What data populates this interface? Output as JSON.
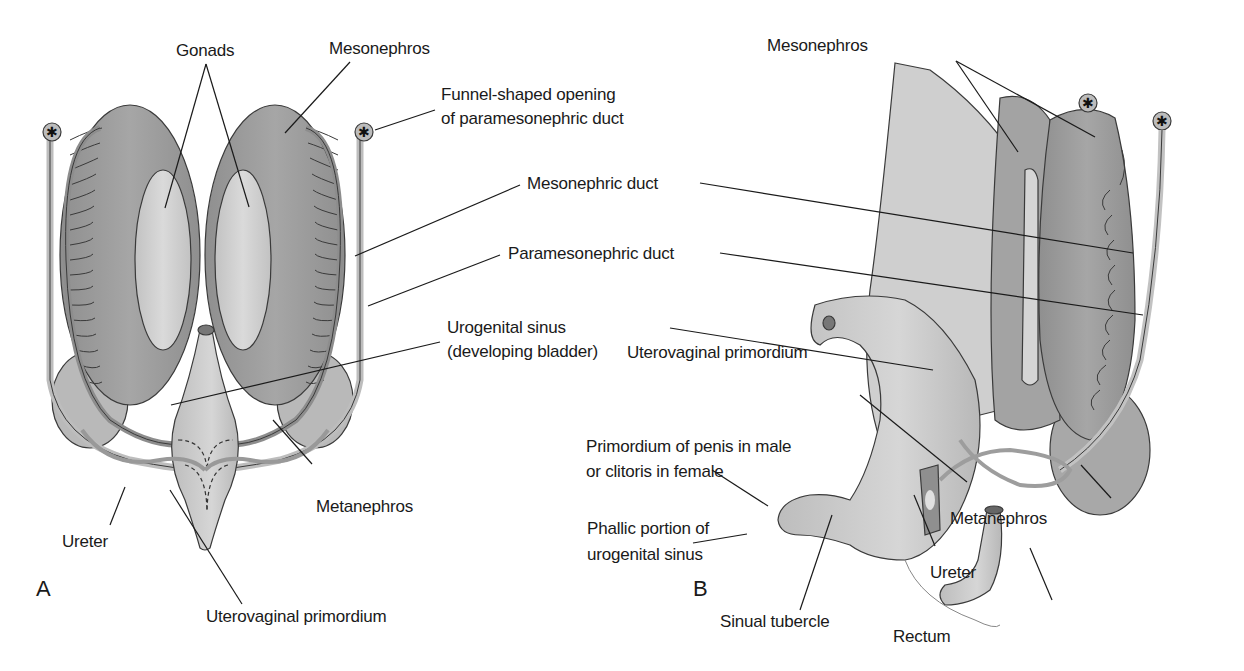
{
  "figure": {
    "panels": [
      {
        "id": "A",
        "label": "A"
      },
      {
        "id": "B",
        "label": "B"
      }
    ],
    "labels_a": {
      "gonads": "Gonads",
      "mesonephros": "Mesonephros",
      "funnel_line1": "Funnel-shaped opening",
      "funnel_line2": "of paramesonephric duct",
      "mesonephric_duct": "Mesonephric duct",
      "paramesonephric_duct": "Paramesonephric duct",
      "urogenital_line1": "Urogenital sinus",
      "urogenital_line2": "(developing bladder)",
      "metanephros": "Metanephros",
      "ureter": "Ureter",
      "uterovaginal": "Uterovaginal primordium"
    },
    "labels_b": {
      "mesonephros": "Mesonephros",
      "uterovaginal": "Uterovaginal primordium",
      "primordium_line1": "Primordium of penis in male",
      "primordium_line2": "or clitoris in female",
      "phallic_line1": "Phallic portion of",
      "phallic_line2": "urogenital sinus",
      "metanephros": "Metanephros",
      "ureter": "Ureter",
      "sinual_tubercle": "Sinual tubercle",
      "rectum": "Rectum"
    },
    "colors": {
      "background": "#ffffff",
      "dark_tissue": "#9a9a9a",
      "mid_tissue": "#b4b4b4",
      "light_tissue": "#cdcdcd",
      "outline": "#3a3a3a",
      "text": "#1a1a1a"
    }
  }
}
